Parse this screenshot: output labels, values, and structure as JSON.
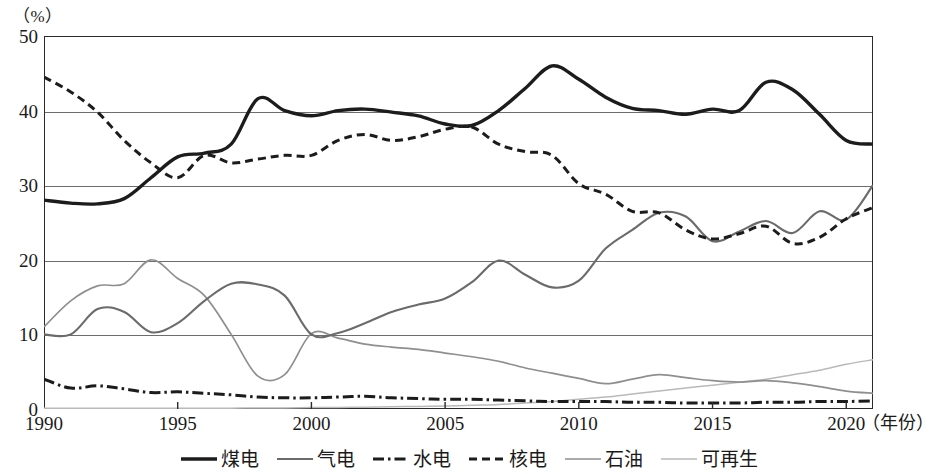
{
  "axes": {
    "unit_label": "（%）",
    "x_axis_title": "（年份）",
    "y_ticks": [
      "0",
      "10",
      "20",
      "30",
      "40",
      "50"
    ],
    "x_ticks": [
      "1990",
      "1995",
      "2000",
      "2005",
      "2010",
      "2015",
      "2020"
    ]
  },
  "legend": {
    "items": [
      {
        "label": "煤电",
        "style": "solid-thick",
        "color": "#1c1c1c"
      },
      {
        "label": "气电",
        "style": "solid-medium",
        "color": "#6b6b6b"
      },
      {
        "label": "水电",
        "style": "dash-dot",
        "color": "#1c1c1c"
      },
      {
        "label": "核电",
        "style": "dashed",
        "color": "#1c1c1c"
      },
      {
        "label": "石油",
        "style": "solid-thin",
        "color": "#8f8f8f"
      },
      {
        "label": "可再生",
        "style": "solid-faint",
        "color": "#b9b9b9"
      }
    ]
  },
  "chart_data": {
    "type": "line",
    "title": "",
    "subtitle": "",
    "xlabel": "（年份）",
    "ylabel": "（%）",
    "xlim": [
      1990,
      2021
    ],
    "ylim": [
      0,
      50
    ],
    "yticks": [
      0,
      10,
      20,
      30,
      40,
      50
    ],
    "xticks": [
      1990,
      1995,
      2000,
      2005,
      2010,
      2015,
      2020
    ],
    "grid": "horizontal",
    "legend_position": "bottom",
    "x": [
      1990,
      1991,
      1992,
      1993,
      1994,
      1995,
      1996,
      1997,
      1998,
      1999,
      2000,
      2001,
      2002,
      2003,
      2004,
      2005,
      2006,
      2007,
      2008,
      2009,
      2010,
      2011,
      2012,
      2013,
      2014,
      2015,
      2016,
      2017,
      2018,
      2019,
      2020,
      2021
    ],
    "series": [
      {
        "name": "煤电",
        "color": "#1c1c1c",
        "style": "solid-thick",
        "values": [
          28.0,
          27.6,
          27.5,
          28.2,
          31.0,
          33.8,
          34.3,
          35.5,
          41.6,
          40.0,
          39.3,
          40.0,
          40.2,
          39.8,
          39.3,
          38.2,
          38.0,
          40.0,
          43.0,
          46.0,
          44.2,
          41.8,
          40.3,
          40.0,
          39.5,
          40.2,
          40.0,
          43.8,
          42.8,
          39.5,
          36.0,
          35.5
        ]
      },
      {
        "name": "气电",
        "color": "#6b6b6b",
        "style": "solid-medium",
        "values": [
          10.0,
          10.0,
          13.4,
          13.0,
          10.3,
          11.5,
          14.5,
          16.8,
          16.7,
          15.2,
          10.0,
          10.2,
          11.5,
          13.0,
          14.0,
          14.8,
          17.0,
          19.9,
          18.0,
          16.3,
          17.2,
          21.5,
          24.0,
          26.3,
          25.8,
          22.5,
          23.8,
          25.2,
          23.6,
          26.5,
          25.4,
          30.0
        ]
      },
      {
        "name": "水电",
        "color": "#1c1c1c",
        "style": "dash-dot",
        "values": [
          4.0,
          2.8,
          3.1,
          2.7,
          2.2,
          2.3,
          2.1,
          1.9,
          1.6,
          1.5,
          1.5,
          1.6,
          1.7,
          1.5,
          1.4,
          1.3,
          1.3,
          1.2,
          1.1,
          1.0,
          1.0,
          1.0,
          0.9,
          0.9,
          0.8,
          0.8,
          0.8,
          0.9,
          0.9,
          1.0,
          1.0,
          1.1
        ]
      },
      {
        "name": "核电",
        "color": "#1c1c1c",
        "style": "dashed",
        "values": [
          44.5,
          42.5,
          39.8,
          36.0,
          33.0,
          31.0,
          34.0,
          33.0,
          33.5,
          34.0,
          34.0,
          36.0,
          36.8,
          36.0,
          36.5,
          37.5,
          37.8,
          35.5,
          34.5,
          34.0,
          30.2,
          28.8,
          26.5,
          26.3,
          24.0,
          22.8,
          23.5,
          24.5,
          22.2,
          23.0,
          25.5,
          27.0
        ]
      },
      {
        "name": "石油",
        "color": "#8f8f8f",
        "style": "solid-thin",
        "values": [
          11.0,
          14.5,
          16.5,
          16.8,
          20.0,
          17.5,
          15.2,
          10.0,
          4.4,
          4.6,
          10.1,
          9.5,
          8.7,
          8.3,
          8.0,
          7.5,
          7.0,
          6.4,
          5.5,
          4.8,
          4.1,
          3.4,
          4.0,
          4.6,
          4.2,
          3.8,
          3.6,
          3.8,
          3.5,
          3.0,
          2.4,
          2.1
        ]
      },
      {
        "name": "可再生",
        "color": "#b9b9b9",
        "style": "solid-faint",
        "values": [
          0.1,
          0.1,
          0.1,
          0.1,
          0.1,
          0.1,
          0.1,
          0.1,
          0.15,
          0.15,
          0.2,
          0.2,
          0.25,
          0.3,
          0.35,
          0.4,
          0.5,
          0.6,
          0.8,
          1.0,
          1.3,
          1.6,
          2.0,
          2.4,
          2.8,
          3.2,
          3.6,
          4.0,
          4.6,
          5.2,
          6.0,
          6.6
        ]
      }
    ]
  }
}
